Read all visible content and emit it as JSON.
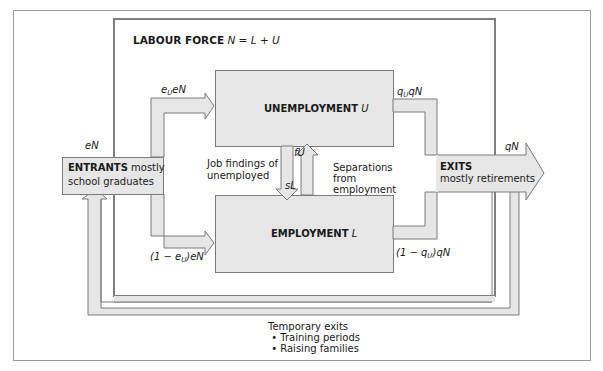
{
  "title": {
    "bold": "LABOUR FORCE",
    "equation": "N = L + U"
  },
  "boxes": {
    "unemployment": {
      "label": "UNEMPLOYMENT",
      "symbol": "U"
    },
    "employment": {
      "label": "EMPLOYMENT",
      "symbol": "L"
    },
    "entrants": {
      "label": "ENTRANTS",
      "line1_rest": "mostly",
      "line2": "school graduates"
    },
    "exits": {
      "label": "EXITS",
      "line2": "mostly retirements"
    }
  },
  "flows": {
    "entrants_total": "eN",
    "to_unemployment": {
      "a": "e",
      "sub": "U",
      "b": "eN"
    },
    "to_employment": {
      "a": "(1 − e",
      "sub": "U",
      "b": ")eN"
    },
    "from_unemployment": {
      "a": "q",
      "sub": "U",
      "b": "qN"
    },
    "from_employment": {
      "a": "(1 − q",
      "sub": "U",
      "b": ")qN"
    },
    "exits_total": "qN",
    "job_findings": {
      "symbol": "fU",
      "line1": "Job findings of",
      "line2": "unemployed"
    },
    "separations": {
      "symbol": "sL",
      "line1": "Separations",
      "line2": "from",
      "line3": "employment"
    }
  },
  "temporary_exits": {
    "heading": "Temporary exits",
    "items": [
      "• Training periods",
      "• Raising families"
    ]
  },
  "colors": {
    "box_fill": "#e6e6e6",
    "stroke": "#7a7a7a",
    "frame": "#8c8c8c"
  }
}
